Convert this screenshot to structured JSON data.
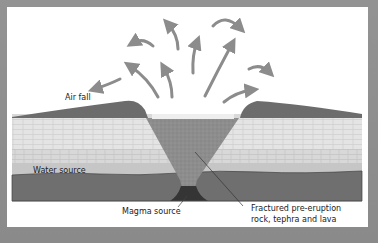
{
  "diagram": {
    "labels": {
      "air_fall": "Air fall",
      "water_source": "Water source",
      "magma_source": "Magma source",
      "fractured_line1": "Fractured pre-eruption",
      "fractured_line2": "rock, tephra and lava"
    },
    "colors": {
      "frame": "#8f8f8f",
      "panel": "#ffffff",
      "tephra_ring": "#6e6e6e",
      "bedrock_light": "#e6e6e6",
      "bedrock_mid": "#d3d3d3",
      "aquifer": "#c8c8c8",
      "basement": "#707070",
      "vent_fill": "#8a8a8a",
      "magma": "#3a3a3a",
      "arrow": "#8c8c8c",
      "text": "#222222"
    },
    "ejecta_arrow_count": 11
  }
}
